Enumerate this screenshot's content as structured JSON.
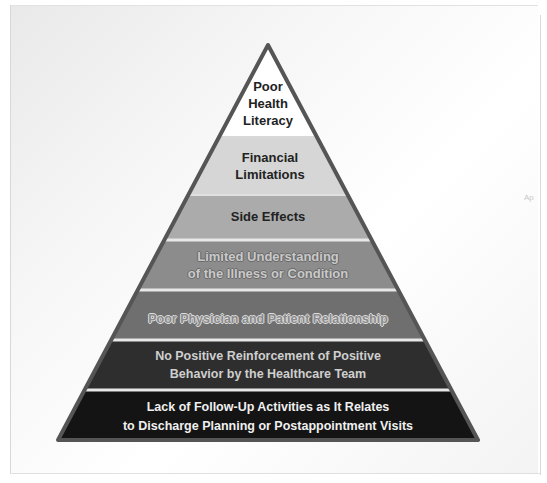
{
  "diagram": {
    "type": "pyramid",
    "title": "",
    "levels": [
      {
        "label_line1": "Poor",
        "label_line2": "Health",
        "label_line3": "Literacy",
        "fill": "#ffffff"
      },
      {
        "label_line1": "Financial",
        "label_line2": "Limitations",
        "fill": "#d6d6d6"
      },
      {
        "label_line1": "Side Effects",
        "fill": "#ababab"
      },
      {
        "label_line1": "Limited Understanding",
        "label_line2": "of the Illness or Condition",
        "fill": "#8c8c8c"
      },
      {
        "label_line1": "Poor Physician and Patient Relationship",
        "fill": "#6f6f6f"
      },
      {
        "label_line1": "No Positive Reinforcement of Positive",
        "label_line2": "Behavior by the Healthcare Team",
        "fill": "#2e2e2e"
      },
      {
        "label_line1": "Lack of Follow-Up Activities as It Relates",
        "label_line2": "to Discharge Planning or Postappointment Visits",
        "fill": "#141414"
      }
    ],
    "outline_color": "#555555",
    "separator_color": "#e8e8e8"
  },
  "corner_mark": "Ap"
}
